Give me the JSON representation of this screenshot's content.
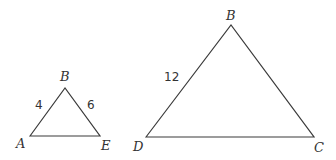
{
  "diagram": {
    "type": "similar-triangles",
    "small_triangle": {
      "vertices": {
        "top": "B",
        "left": "A",
        "right": "E"
      },
      "side_labels": {
        "AB": "4",
        "BE": "6"
      }
    },
    "large_triangle": {
      "vertices": {
        "top": "B",
        "left": "D",
        "right": "C"
      },
      "side_labels": {
        "DB": "12"
      }
    }
  }
}
